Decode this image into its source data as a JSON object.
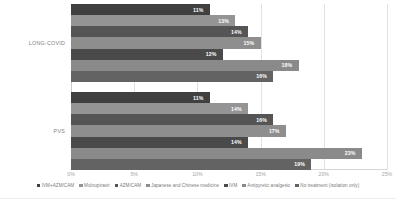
{
  "chart_data": {
    "type": "bar",
    "orientation": "horizontal",
    "title": "",
    "xlabel": "",
    "ylabel": "",
    "xlim": [
      0,
      25
    ],
    "xticks": [
      "0%",
      "5%",
      "10%",
      "15%",
      "20%",
      "25%"
    ],
    "xtick_values": [
      0,
      5,
      10,
      15,
      20,
      25
    ],
    "grid": true,
    "legend_position": "bottom",
    "categories": [
      "LONG-COVID",
      "PVS"
    ],
    "series": [
      {
        "name": "IVM+AZM/CAM",
        "color": "#404040",
        "values": [
          11,
          11
        ],
        "labels": [
          "11%",
          "11%"
        ]
      },
      {
        "name": "Molnupiravir",
        "color": "#949494",
        "values": [
          13,
          14
        ],
        "labels": [
          "13%",
          "14%"
        ]
      },
      {
        "name": "AZM/CAM",
        "color": "#555555",
        "values": [
          14,
          16
        ],
        "labels": [
          "14%",
          "16%"
        ]
      },
      {
        "name": "Japanese and Chinese medicine",
        "color": "#8e8e8e",
        "values": [
          15,
          17
        ],
        "labels": [
          "15%",
          "17%"
        ]
      },
      {
        "name": "IVM",
        "color": "#4a4a4a",
        "values": [
          12,
          14
        ],
        "labels": [
          "12%",
          "14%"
        ]
      },
      {
        "name": "Antipyretic analgesic",
        "color": "#8a8a8a",
        "values": [
          18,
          23
        ],
        "labels": [
          "18%",
          "23%"
        ]
      },
      {
        "name": "No treatment (isolation only)",
        "color": "#636363",
        "values": [
          16,
          19
        ],
        "labels": [
          "16%",
          "19%"
        ]
      }
    ]
  }
}
